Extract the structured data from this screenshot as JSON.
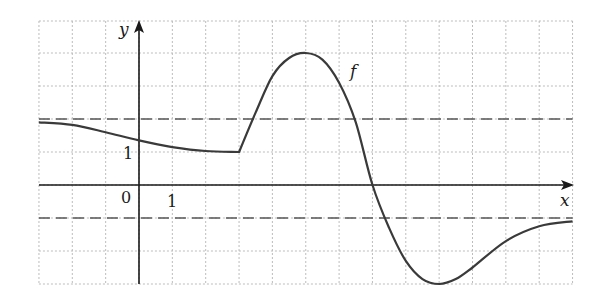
{
  "chart_data": {
    "type": "line",
    "title": "",
    "xlabel": "x",
    "ylabel": "y",
    "function_label": "f",
    "xlim": [
      -3,
      13
    ],
    "ylim": [
      -3,
      5
    ],
    "grid": true,
    "grid_step": 1,
    "origin_label": "0",
    "x_tick_labels": [
      {
        "x": 1,
        "label": "1"
      }
    ],
    "y_tick_labels": [
      {
        "y": 1,
        "label": "1"
      }
    ],
    "horizontal_asymptotes": [
      2,
      -1
    ],
    "series": [
      {
        "name": "f",
        "points": [
          [
            -3,
            1.9
          ],
          [
            -2,
            1.82
          ],
          [
            -1,
            1.6
          ],
          [
            0,
            1.35
          ],
          [
            1,
            1.15
          ],
          [
            2,
            1.03
          ],
          [
            3,
            1.0
          ],
          [
            3.5,
            2.2
          ],
          [
            4,
            3.3
          ],
          [
            4.5,
            3.85
          ],
          [
            5,
            4.0
          ],
          [
            5.5,
            3.8
          ],
          [
            6,
            3.1
          ],
          [
            6.5,
            1.9
          ],
          [
            7,
            0.0
          ],
          [
            7.5,
            -1.3
          ],
          [
            8,
            -2.3
          ],
          [
            8.5,
            -2.85
          ],
          [
            9,
            -3.0
          ],
          [
            9.5,
            -2.85
          ],
          [
            10,
            -2.5
          ],
          [
            11,
            -1.7
          ],
          [
            12,
            -1.25
          ],
          [
            13,
            -1.1
          ]
        ],
        "notes": "Decreasing toward 1 on (-3,3), corner at (3,1), local max (5,4), root at x=7, local min (9,-3), approaches y=-1 as x→∞, approaches y=2 as x→-∞"
      }
    ]
  },
  "labels": {
    "y_axis": "y",
    "x_axis": "x",
    "function": "f",
    "origin": "0",
    "x_one": "1",
    "y_one": "1"
  }
}
